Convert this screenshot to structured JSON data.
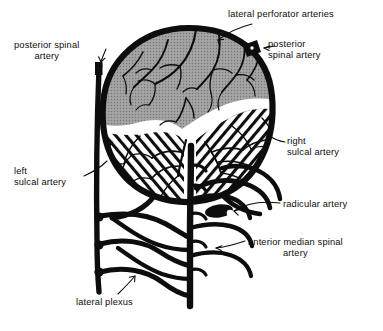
{
  "figure": {
    "background_color": "#ffffff",
    "ink_color": "#0d0d0d",
    "gray_matter_color": "#9a9a9a",
    "white_matter_color": "#ffffff"
  },
  "labels": {
    "lateral_perforator_arteries": "lateral perforator arteries",
    "posterior_spinal_artery_left": "posterior spinal\nartery",
    "posterior_spinal_artery_right": "posterior\nspinal artery",
    "right_sulcal_artery": "right\nsulcal artery",
    "left_sulcal_artery": "left\nsulcal artery",
    "radicular_artery": "radicular artery",
    "anterior_median_spinal_artery": "anterior median spinal\nartery",
    "lateral_plexus": "lateral plexus"
  },
  "regions": {
    "posterior_gray": "posterior-gray-matter",
    "anterior_left_hatched": "left-anterior-white-matter",
    "anterior_right_hatched": "right-anterior-white-matter",
    "central_sulcus": "anterior-median-fissure"
  },
  "vessels": {
    "cord_outline": "spinal-cord-outline",
    "left_trunk": "left-posterior-spinal-trunk",
    "central_trunk": "anterior-median-spinal-trunk",
    "plexus": "lateral-plexus-network",
    "radicular_hooks": "radicular-artery-branches"
  }
}
